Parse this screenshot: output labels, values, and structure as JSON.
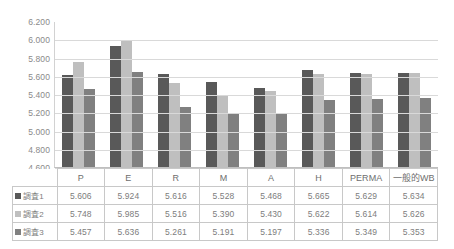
{
  "chart_data": {
    "type": "bar",
    "title": "",
    "xlabel": "",
    "ylabel": "",
    "ylim": [
      4.6,
      6.2
    ],
    "ytick_step": 0.2,
    "grid": true,
    "legend_position": "table-left",
    "categories": [
      "P",
      "E",
      "R",
      "M",
      "A",
      "H",
      "PERMA",
      "一般的WB"
    ],
    "yticks": [
      "6.200",
      "6.000",
      "5.800",
      "5.600",
      "5.400",
      "5.200",
      "5.000",
      "4.800",
      "4.600"
    ],
    "ytick_values": [
      6.2,
      6.0,
      5.8,
      5.6,
      5.4,
      5.2,
      5.0,
      4.8,
      4.6
    ],
    "series": [
      {
        "name": "調査1",
        "color": "#595959",
        "values": [
          5.606,
          5.924,
          5.616,
          5.528,
          5.468,
          5.665,
          5.629,
          5.634
        ],
        "labels": [
          "5.606",
          "5.924",
          "5.616",
          "5.528",
          "5.468",
          "5.665",
          "5.629",
          "5.634"
        ]
      },
      {
        "name": "調査2",
        "color": "#bfbfbf",
        "values": [
          5.748,
          5.985,
          5.516,
          5.39,
          5.43,
          5.622,
          5.614,
          5.626
        ],
        "labels": [
          "5.748",
          "5.985",
          "5.516",
          "5.390",
          "5.430",
          "5.622",
          "5.614",
          "5.626"
        ]
      },
      {
        "name": "調査3",
        "color": "#808080",
        "values": [
          5.457,
          5.636,
          5.261,
          5.191,
          5.197,
          5.336,
          5.349,
          5.353
        ],
        "labels": [
          "5.457",
          "5.636",
          "5.261",
          "5.191",
          "5.197",
          "5.336",
          "5.349",
          "5.353"
        ]
      }
    ]
  }
}
